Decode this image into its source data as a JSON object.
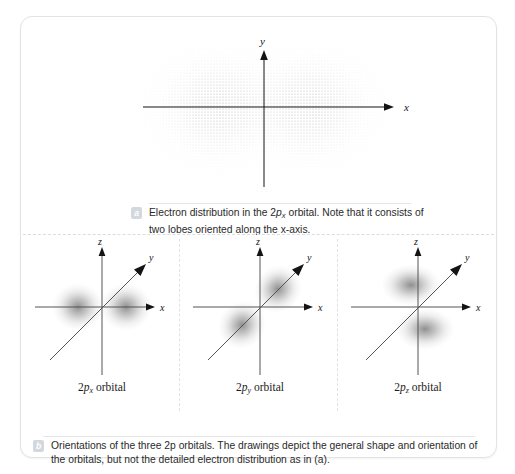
{
  "figure": {
    "panel_a": {
      "badge": "a",
      "caption_line1_pre": "Electron distribution in the 2",
      "caption_p": "p",
      "caption_sub": "x",
      "caption_line1_post": " orbital. Note that",
      "caption_line2": "it consists of two lobes oriented along the x-axis.",
      "caption_full": "Electron distribution in the 2px orbital. Note that it consists of two lobes oriented along the x-axis.",
      "axes": [
        {
          "name": "x-axis",
          "label": "x",
          "direction": "right"
        },
        {
          "name": "y-axis",
          "label": "y",
          "direction": "up"
        }
      ],
      "plot_type": "dot-density electron probability distribution",
      "lobe_count": 2,
      "lobe_orientation": "along x-axis"
    },
    "panel_b": {
      "badge": "b",
      "caption_line1": "Orientations of the three 2p orbitals. The drawings depict the general shape and",
      "caption_line2": "orientation of the orbitals, but not the detailed electron distribution as in (a).",
      "caption_full": "Orientations of the three 2p orbitals. The drawings depict the general shape and orientation of the orbitals, but not the detailed electron distribution as in (a).",
      "orbitals": [
        {
          "label_pre": "2",
          "label_italic": "p",
          "label_sub": "x",
          "label_post": " orbital",
          "label_full": "2px orbital",
          "lobe_axis": "x",
          "axes": [
            "x",
            "y",
            "z"
          ]
        },
        {
          "label_pre": "2",
          "label_italic": "p",
          "label_sub": "y",
          "label_post": " orbital",
          "label_full": "2py orbital",
          "lobe_axis": "y",
          "axes": [
            "x",
            "y",
            "z"
          ]
        },
        {
          "label_pre": "2",
          "label_italic": "p",
          "label_sub": "z",
          "label_post": " orbital",
          "label_full": "2pz orbital",
          "lobe_axis": "z",
          "axes": [
            "x",
            "y",
            "z"
          ]
        }
      ]
    },
    "colors": {
      "card_border": "#e3e3e3",
      "background": "#ffffff",
      "axis": "#141414",
      "lobe": "#9a9a9a",
      "dot": "#8e8e8e",
      "badge": "#d2d8dd",
      "divider": "#dfe3e7",
      "text": "#2a2a2a"
    }
  }
}
